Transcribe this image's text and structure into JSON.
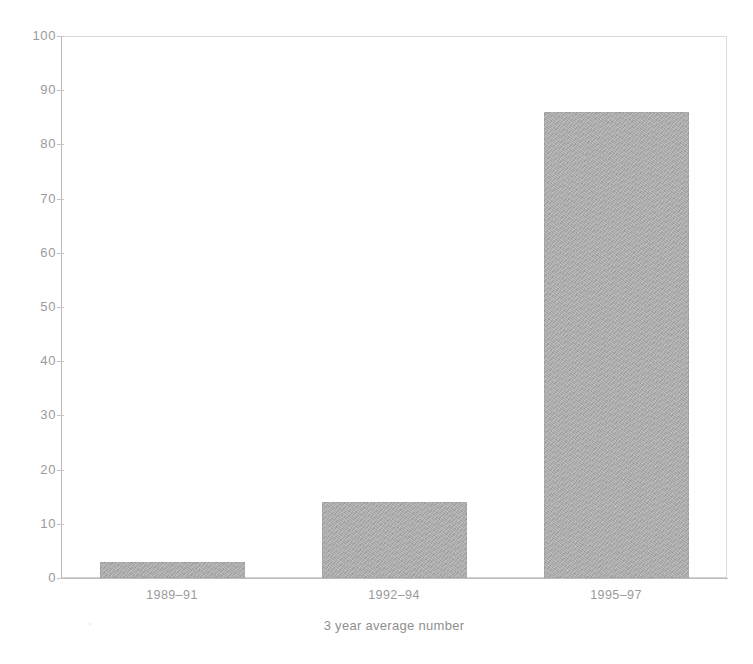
{
  "chart_data": {
    "type": "bar",
    "title": "",
    "subtitle": "",
    "xlabel": "3 year average number",
    "ylabel": "",
    "categories": [
      "1989–91",
      "1992–94",
      "1995–97"
    ],
    "values": [
      3,
      14,
      86
    ],
    "series": [
      {
        "name": "3 year average number",
        "values": [
          3,
          14,
          86
        ]
      }
    ],
    "ylim": [
      0,
      100
    ],
    "y_ticks": [
      0,
      10,
      20,
      30,
      40,
      50,
      60,
      70,
      80,
      90,
      100
    ],
    "y_tick_labels": [
      "0",
      "10",
      "20",
      "30",
      "40",
      "50",
      "60",
      "70",
      "80",
      "90",
      "100"
    ],
    "grid": false,
    "legend": false,
    "legend_position": "none",
    "bar_color": "#a9a9a9",
    "axis_color": "#bdbdbd",
    "text_color": "#9a9a9a",
    "background": "#ffffff",
    "annotations": []
  },
  "axis": {
    "x_title": "3 year average number"
  }
}
